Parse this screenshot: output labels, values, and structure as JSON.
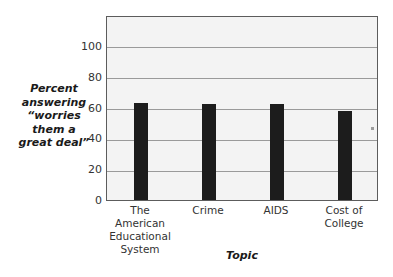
{
  "chart_data": {
    "type": "bar",
    "title": "",
    "categories": [
      "The American Educational System",
      "Crime",
      "AIDS",
      "Cost of College"
    ],
    "category_lines": [
      [
        "The American",
        "Educational",
        "System"
      ],
      [
        "Crime"
      ],
      [
        "AIDS"
      ],
      [
        "Cost of",
        "College"
      ]
    ],
    "values": [
      63,
      62,
      62,
      58
    ],
    "xlabel": "Topic",
    "ylabel": "Percent answering “worries them a great deal”",
    "ylabel_lines": [
      "Percent",
      "answering",
      "“worries",
      "them a",
      "great deal”"
    ],
    "ylim": [
      0,
      120
    ],
    "yticks": [
      0,
      20,
      40,
      60,
      80,
      100
    ],
    "ytick_labels": [
      "0",
      "20",
      "40",
      "60",
      "80",
      "100"
    ],
    "grid": true,
    "grid_axis": "y",
    "legend": false,
    "bar_color": "#1c1c1c",
    "plot_background": "#f3f3f3",
    "grid_color": "#9a9a9a",
    "frame_color": "#5c5c5c"
  }
}
